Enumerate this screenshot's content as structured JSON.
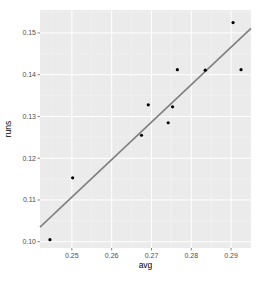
{
  "chart_data": {
    "type": "scatter",
    "title": "",
    "xlabel": "avg",
    "ylabel": "runs",
    "xlim": [
      0.242,
      0.295
    ],
    "ylim": [
      0.0985,
      0.1555
    ],
    "x_ticks": [
      0.25,
      0.26,
      0.27,
      0.28,
      0.29
    ],
    "x_tick_labels": [
      "0.25",
      "0.26",
      "0.27",
      "0.28",
      "0.29"
    ],
    "y_ticks": [
      0.1,
      0.11,
      0.12,
      0.13,
      0.14,
      0.15
    ],
    "y_tick_labels": [
      "0.10",
      "0.11",
      "0.12",
      "0.13",
      "0.14",
      "0.15"
    ],
    "grid": true,
    "legend": "none",
    "points": [
      {
        "x": 0.2445,
        "y": 0.1005
      },
      {
        "x": 0.2502,
        "y": 0.1153
      },
      {
        "x": 0.2675,
        "y": 0.1255
      },
      {
        "x": 0.2692,
        "y": 0.1328
      },
      {
        "x": 0.2742,
        "y": 0.1285
      },
      {
        "x": 0.2753,
        "y": 0.1323
      },
      {
        "x": 0.2765,
        "y": 0.1412
      },
      {
        "x": 0.2835,
        "y": 0.1411
      },
      {
        "x": 0.2905,
        "y": 0.1525
      },
      {
        "x": 0.2925,
        "y": 0.1412
      }
    ],
    "fit_line": {
      "type": "linear",
      "x": [
        0.242,
        0.295
      ],
      "y": [
        0.1035,
        0.1511
      ]
    },
    "colors": {
      "panel_background": "#ebebeb",
      "grid_major": "#ffffff",
      "grid_minor": "#f5f5f5",
      "point": "#000000",
      "fit_line": "#808080"
    }
  }
}
